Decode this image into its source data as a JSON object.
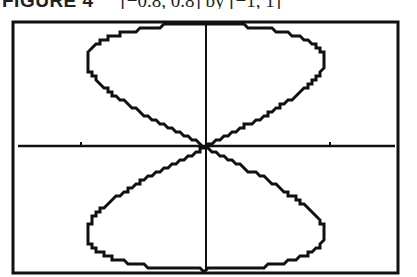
{
  "caption": {
    "figure_label": "FIGURE 4",
    "window": "[−0.8, 0.8] by [−1, 1]"
  },
  "chart_data": {
    "type": "line",
    "title": "",
    "parametric": {
      "x": "sin(t)·cos(t)",
      "y": "sin(t)",
      "t_range": [
        0,
        6.2832
      ]
    },
    "xlim": [
      -0.8,
      0.8
    ],
    "ylim": [
      -1,
      1
    ],
    "x_ticks": [
      -0.5,
      0.5
    ],
    "y_ticks": [],
    "grid": false,
    "legend": null,
    "series": [
      {
        "name": "figure-eight",
        "x": [
          0,
          0.22,
          0.38,
          0.47,
          0.5,
          0.47,
          0.38,
          0.22,
          0,
          -0.22,
          -0.38,
          -0.47,
          -0.5,
          -0.47,
          -0.38,
          -0.22,
          0,
          0.22,
          0.38,
          0.47,
          0.5,
          0.47,
          0.38,
          0.22,
          0,
          -0.22,
          -0.38,
          -0.47,
          -0.5,
          -0.47,
          -0.38,
          -0.22,
          0
        ],
        "y": [
          0,
          0.26,
          0.5,
          0.64,
          0.71,
          0.78,
          0.87,
          0.95,
          1,
          0.95,
          0.87,
          0.78,
          0.71,
          0.64,
          0.5,
          0.26,
          0,
          -0.26,
          -0.5,
          -0.64,
          -0.71,
          -0.78,
          -0.87,
          -0.95,
          -1,
          -0.95,
          -0.87,
          -0.78,
          -0.71,
          -0.64,
          -0.5,
          -0.26,
          0
        ]
      }
    ],
    "colors": {
      "curve": "#111111",
      "axes": "#111111",
      "frame": "#111111",
      "background": "#ffffff"
    }
  }
}
